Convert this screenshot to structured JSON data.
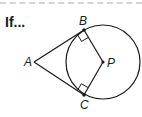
{
  "heading": {
    "text": "If..."
  },
  "diagram": {
    "labels": {
      "A": "A",
      "B": "B",
      "C": "C",
      "P": "P"
    },
    "stroke_color": "#1a1a1a",
    "dash_color": "#d4d4d4",
    "points": {
      "A": [
        34,
        62
      ],
      "B": [
        84,
        30
      ],
      "C": [
        84,
        95
      ],
      "P": [
        103,
        62
      ]
    },
    "circle": {
      "center": "P",
      "radius": 37
    },
    "segments": [
      "AB",
      "AC",
      "BP",
      "CP"
    ],
    "right_angles": [
      "ABP",
      "ACP"
    ]
  }
}
